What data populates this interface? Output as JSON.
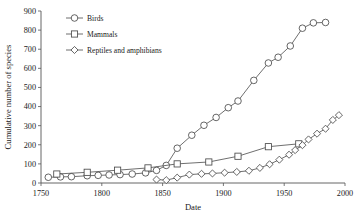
{
  "chart_data": {
    "type": "line",
    "title": "",
    "xlabel": "Date",
    "ylabel": "Cumulative number of species",
    "xlim": [
      1750,
      2000
    ],
    "ylim": [
      0,
      900
    ],
    "xticks": [
      1750,
      1800,
      1850,
      1900,
      1950,
      2000
    ],
    "xtick_labels": [
      "1750",
      "1800",
      "1850",
      "1900",
      "1950",
      "2000"
    ],
    "yticks": [
      0,
      100,
      200,
      300,
      400,
      500,
      600,
      700,
      800,
      900
    ],
    "ytick_labels": [
      "0",
      "100",
      "200",
      "300",
      "400",
      "500",
      "600",
      "700",
      "800",
      "900"
    ],
    "grid": false,
    "legend_position": "top-left",
    "series": [
      {
        "name": "Birds",
        "marker": "circle",
        "points": [
          [
            1756,
            30
          ],
          [
            1766,
            32
          ],
          [
            1775,
            33
          ],
          [
            1788,
            38
          ],
          [
            1797,
            40
          ],
          [
            1806,
            42
          ],
          [
            1815,
            44
          ],
          [
            1825,
            47
          ],
          [
            1836,
            53
          ],
          [
            1845,
            66
          ],
          [
            1853,
            92
          ],
          [
            1862,
            182
          ],
          [
            1874,
            250
          ],
          [
            1884,
            302
          ],
          [
            1894,
            343
          ],
          [
            1904,
            394
          ],
          [
            1912,
            429
          ],
          [
            1925,
            537
          ],
          [
            1937,
            628
          ],
          [
            1945,
            658
          ],
          [
            1955,
            717
          ],
          [
            1965,
            810
          ],
          [
            1974,
            838
          ],
          [
            1984,
            840
          ]
        ]
      },
      {
        "name": "Mammals",
        "marker": "square",
        "points": [
          [
            1763,
            47
          ],
          [
            1788,
            56
          ],
          [
            1813,
            67
          ],
          [
            1838,
            79
          ],
          [
            1862,
            100
          ],
          [
            1888,
            110
          ],
          [
            1912,
            140
          ],
          [
            1937,
            190
          ],
          [
            1962,
            205
          ]
        ]
      },
      {
        "name": "Reptiles and amphibians",
        "marker": "diamond",
        "points": [
          [
            1845,
            18
          ],
          [
            1853,
            15
          ],
          [
            1862,
            28
          ],
          [
            1872,
            44
          ],
          [
            1882,
            48
          ],
          [
            1891,
            50
          ],
          [
            1901,
            54
          ],
          [
            1911,
            58
          ],
          [
            1921,
            64
          ],
          [
            1930,
            79
          ],
          [
            1938,
            98
          ],
          [
            1946,
            122
          ],
          [
            1954,
            148
          ],
          [
            1959,
            172
          ],
          [
            1965,
            198
          ],
          [
            1970,
            228
          ],
          [
            1977,
            258
          ],
          [
            1984,
            284
          ],
          [
            1990,
            330
          ],
          [
            1995,
            355
          ]
        ]
      }
    ],
    "legend": [
      {
        "label": "Birds",
        "marker": "circle"
      },
      {
        "label": "Mammals",
        "marker": "square"
      },
      {
        "label": "Reptiles and amphibians",
        "marker": "diamond"
      }
    ],
    "colors": {
      "line": "#4a4a4a",
      "marker_fill": "#ffffff",
      "axis": "#555555",
      "text": "#1a1a1a",
      "background": "#ffffff"
    }
  }
}
